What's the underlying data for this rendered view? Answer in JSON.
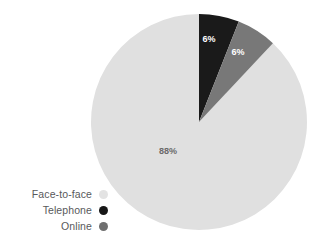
{
  "chart_data": {
    "type": "pie",
    "title": "",
    "subtitle": "",
    "xlabel": "",
    "ylabel": "",
    "grid": false,
    "legend_position": "bottom-left",
    "start_angle_deg": 0,
    "direction": "clockwise",
    "units": "percent",
    "categories": [
      "Face-to-face",
      "Telephone",
      "Online"
    ],
    "values": [
      88,
      6,
      6
    ],
    "slices": [
      {
        "label": "Telephone",
        "value": 6,
        "data_label": "6%",
        "color": "#1a1a1a",
        "label_color": "#ffffff"
      },
      {
        "label": "Online",
        "value": 6,
        "data_label": "6%",
        "color": "#787878",
        "label_color": "#ffffff"
      },
      {
        "label": "Face-to-face",
        "value": 88,
        "data_label": "88%",
        "color": "#e0e0e0",
        "label_color": "#6a6a6a"
      }
    ]
  },
  "legend": {
    "items": [
      {
        "label": "Face-to-face",
        "color": "#e3e3e3"
      },
      {
        "label": "Telephone",
        "color": "#161616"
      },
      {
        "label": "Online",
        "color": "#6f6f6f"
      }
    ]
  },
  "labels": {
    "telephone": "6%",
    "online": "6%",
    "face_to_face": "88%"
  },
  "colors": {
    "face_to_face": "#e0e0e0",
    "telephone": "#1a1a1a",
    "online": "#787878",
    "legend_text": "#58595b",
    "background": "#ffffff"
  }
}
